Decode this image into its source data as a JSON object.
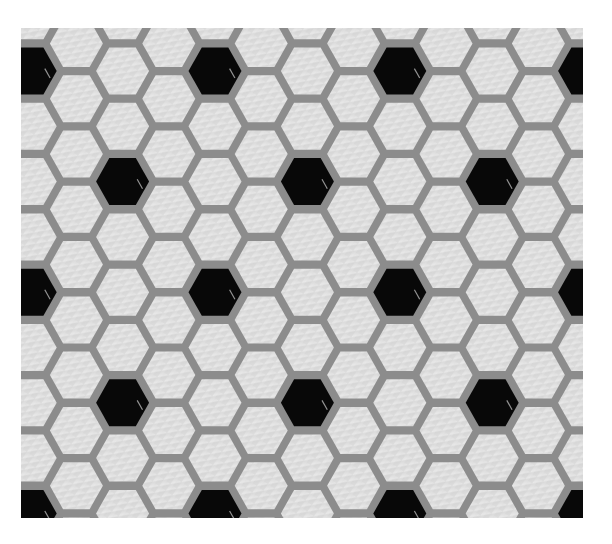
{
  "image": {
    "subject": "Hexagonal mosaic floor tile pattern",
    "description": "White glossy flat-top hexagon tiles with grey grout; black hexagon tiles arranged in a regular repeating lattice",
    "canvas": {
      "width": 612,
      "height": 544,
      "background": "#ffffff"
    },
    "photo_area": {
      "x": 21,
      "y": 28,
      "width": 562,
      "height": 490
    }
  },
  "tiles": {
    "shape": "flat-top-hexagon",
    "origin_col_x": 215,
    "origin_row_y": 71,
    "col_pitch": 46.2,
    "row_pitch": 55.3,
    "tile_width": 53,
    "tile_height": 47,
    "col_range": [
      -5,
      9
    ],
    "row_range": [
      -2,
      10
    ],
    "black_rule": "col%4==0 && row%4==0 || col%4==2 && row%4==2 (even cols use integer rows)"
  },
  "colors": {
    "grout": "#8c8c8c",
    "white_tile": "#dcdcdc",
    "white_tile_highlight": "#ececec",
    "black_tile": "#080808",
    "black_tile_gloss": "#cfcfcf"
  },
  "black_tile_centers": [
    [
      21,
      71
    ],
    [
      215,
      71
    ],
    [
      397,
      71
    ],
    [
      583,
      71
    ],
    [
      122,
      181
    ],
    [
      307,
      181
    ],
    [
      492,
      181
    ],
    [
      21,
      292
    ],
    [
      215,
      292
    ],
    [
      397,
      292
    ],
    [
      583,
      292
    ],
    [
      122,
      403
    ],
    [
      307,
      403
    ],
    [
      492,
      403
    ],
    [
      21,
      513
    ],
    [
      215,
      513
    ],
    [
      397,
      513
    ],
    [
      583,
      513
    ]
  ]
}
